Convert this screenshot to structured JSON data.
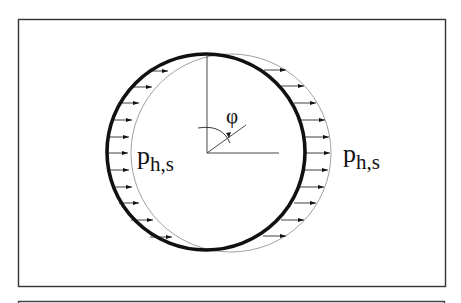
{
  "diagram": {
    "type": "pipe-ovalization-under-pressure",
    "labels": {
      "angle": "φ",
      "pressure_left_main": "p",
      "pressure_left_sub": "h,s",
      "pressure_right_main": "p",
      "pressure_right_sub": "h,s"
    },
    "colors": {
      "stroke": "#111111",
      "thin_stroke": "#777777",
      "background": "#ffffff",
      "frame": "#333333"
    }
  }
}
